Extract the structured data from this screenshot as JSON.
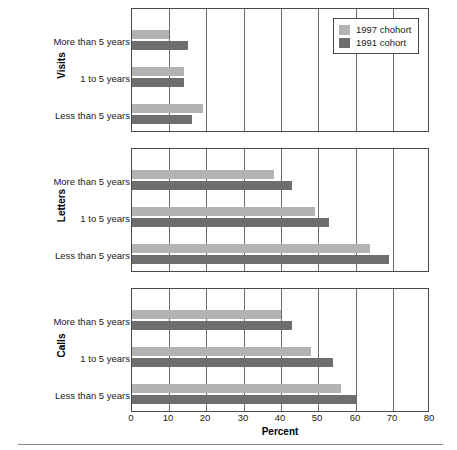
{
  "chart_data": {
    "type": "bar",
    "orientation": "horizontal",
    "title": "",
    "xlabel": "Percent",
    "ylabel": "",
    "xlim": [
      0,
      80
    ],
    "xticks": [
      0,
      10,
      20,
      30,
      40,
      50,
      60,
      70,
      80
    ],
    "grid": true,
    "legend_position": "top-right",
    "legend": [
      "1997 chohort",
      "1991 cohort"
    ],
    "categories": [
      "Less than 5 years",
      "1 to 5 years",
      "More than 5 years"
    ],
    "panels": [
      {
        "name": "Visits",
        "series": [
          {
            "name": "1997 chohort",
            "values": [
              19,
              14,
              10
            ]
          },
          {
            "name": "1991 cohort",
            "values": [
              16,
              14,
              15
            ]
          }
        ]
      },
      {
        "name": "Letters",
        "series": [
          {
            "name": "1997 chohort",
            "values": [
              64,
              49,
              38
            ]
          },
          {
            "name": "1991 cohort",
            "values": [
              69,
              53,
              43
            ]
          }
        ]
      },
      {
        "name": "Calls",
        "series": [
          {
            "name": "1997 chohort",
            "values": [
              56,
              48,
              40
            ]
          },
          {
            "name": "1991 cohort",
            "values": [
              60,
              54,
              43
            ]
          }
        ]
      }
    ]
  },
  "colors": {
    "series_1997": "#b3b3b3",
    "series_1991": "#6e6e6e",
    "axis": "#4a4a4a",
    "grid": "#6b6b6b",
    "text": "#1a1a1a"
  },
  "legend": {
    "items": [
      {
        "label": "1997 chohort",
        "swatch": "#b3b3b3"
      },
      {
        "label": "1991 cohort",
        "swatch": "#6e6e6e"
      }
    ]
  },
  "axis": {
    "x_title": "Percent",
    "tick_0": "0",
    "tick_10": "10",
    "tick_20": "20",
    "tick_30": "30",
    "tick_40": "40",
    "tick_50": "50",
    "tick_60": "60",
    "tick_70": "70",
    "tick_80": "80"
  },
  "panels": {
    "visits": {
      "title": "Visits",
      "cat_more": "More than 5 years",
      "cat_mid": "1 to 5 years",
      "cat_less": "Less than 5 years"
    },
    "letters": {
      "title": "Letters",
      "cat_more": "More than 5 years",
      "cat_mid": "1 to 5 years",
      "cat_less": "Less than 5 years"
    },
    "calls": {
      "title": "Calls",
      "cat_more": "More than 5 years",
      "cat_mid": "1 to 5 years",
      "cat_less": "Less than 5 years"
    }
  }
}
